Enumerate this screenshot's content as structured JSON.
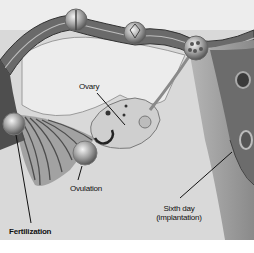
{
  "diagram": {
    "palette": {
      "background": "#ffffff",
      "paper": "#dcdcdc",
      "tube_dark": "#5a5a5a",
      "tube_mid": "#8c8c8c",
      "ligament": "#e8e8e8",
      "uterus_wall": "#9a9a9a",
      "uterus_cavity": "#6e6e6e",
      "ink": "#111111"
    },
    "labels": {
      "ovary": "Ovary",
      "ovulation": "Ovulation",
      "fertilization": "Fertilization",
      "implantation_line1": "Sixth day",
      "implantation_line2": "(implantation)"
    }
  }
}
